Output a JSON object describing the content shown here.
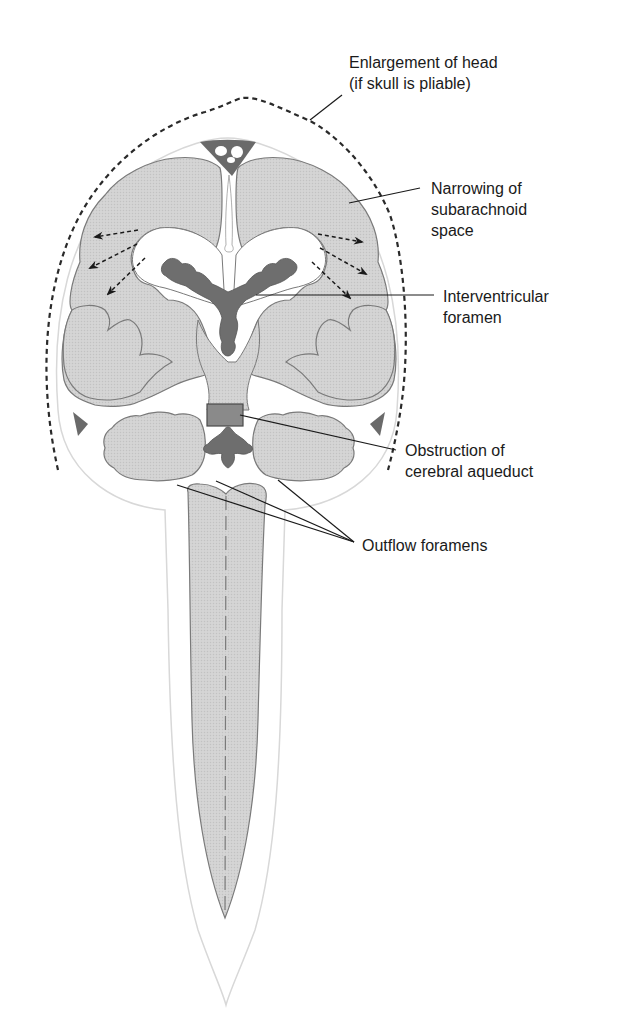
{
  "diagram": {
    "colors": {
      "tissue": "#d4d4d4",
      "tissue_outline": "#7a7a7a",
      "choroid_plexus": "#6e6e6e",
      "obstruction": "#8a8a8a",
      "sinus": "#6a6a6a",
      "dashed_outline": "#2a2a2a",
      "leader_line": "#1a1a1a",
      "meninges": "#d8d8d8",
      "background": "#ffffff"
    },
    "labels": [
      {
        "id": "enlargement",
        "lines": [
          "Enlargement of head",
          "(if skull is pliable)"
        ]
      },
      {
        "id": "narrowing",
        "lines": [
          "Narrowing of",
          "subarachnoid",
          "space"
        ]
      },
      {
        "id": "interventricular",
        "lines": [
          "Interventricular",
          "foramen"
        ]
      },
      {
        "id": "obstruction",
        "lines": [
          "Obstruction of",
          "cerebral aqueduct"
        ]
      },
      {
        "id": "outflow",
        "lines": [
          "Outflow foramens"
        ]
      }
    ],
    "arrows": {
      "description": "Dashed arrows showing pressure from enlarged lateral ventricles outward",
      "left_count": 3,
      "right_count": 3
    }
  }
}
